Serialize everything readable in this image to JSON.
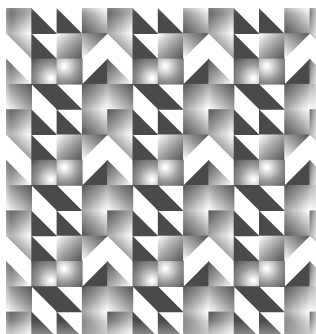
{
  "artwork": {
    "title": "Grayscale Geometric Quilt Pattern",
    "kind": "repeating-tile-pattern",
    "canvas": {
      "width": 316,
      "height": 334,
      "background": "#ffffff"
    },
    "pattern_area": {
      "x": 6,
      "y": 8,
      "width": 304,
      "height": 316
    },
    "grid": {
      "cell_size": 25.3,
      "columns": 12,
      "rows": 12.5,
      "motif_period_cells": 4
    },
    "palette": {
      "background": "#ffffff",
      "dark": "#4a4a4a",
      "mid_dark": "#6e6e6e",
      "mid": "#9a9a9a",
      "light": "#d8d8d8",
      "highlight": "#ffffff",
      "gradient_dark_stop": "#555555",
      "gradient_light_stop": "#ffffff"
    },
    "shapes": {
      "gradient_square": "square filled with a linear/radial grayscale gradient",
      "triangle_lower_left": "right triangle occupying the lower-left half of a cell",
      "triangle_upper_right": "right triangle occupying the upper-right half of a cell",
      "triangle_lower_right": "right triangle occupying the lower-right half of a cell",
      "triangle_upper_left": "right triangle occupying the upper-left half of a cell",
      "arrow_block": "large dark arrow / chevron formed by adjoining triangles",
      "nested_corner": "L-shaped nested corner of gradient squares"
    },
    "motif": {
      "size_cells": 4,
      "description": "Four-by-four cell tile combining dark solid triangles forming arrow heads with radial gradient squares that fade from dark grey at one corner to white at the opposite corner.",
      "cells": [
        [
          "gradient_square_tl_dark",
          "triangle_lower_left_dark",
          "triangle_lower_left_dark",
          "gradient_square_bl_dark"
        ],
        [
          "triangle_upper_right_grad",
          "triangle_lower_left_dark",
          "gradient_square_br_dark",
          "triangle_upper_left_grad"
        ],
        [
          "triangle_lower_left_grad",
          "gradient_square_radial",
          "nested_corner_grad",
          "triangle_lower_right_dark"
        ],
        [
          "gradient_square_tr_dark",
          "triangle_upper_right_dark",
          "triangle_lower_left_dark",
          "gradient_square_tl_dark"
        ]
      ]
    },
    "counts": {
      "motif_repeats_x": 3,
      "motif_repeats_y": 3,
      "approx_cells_total": 150
    }
  },
  "chart_data": {
    "type": "heatmap",
    "title": "Grayscale Geometric Quilt Pattern",
    "xlabel": "",
    "ylabel": "",
    "grid": true,
    "legend": "none",
    "categories": [
      "col1",
      "col2",
      "col3",
      "col4",
      "col5",
      "col6",
      "col7",
      "col8",
      "col9",
      "col10",
      "col11",
      "col12"
    ],
    "values": [
      [
        0.55,
        0.85,
        0.85,
        0.55,
        0.55,
        0.85,
        0.85,
        0.55,
        0.55,
        0.85,
        0.85,
        0.55
      ],
      [
        0.4,
        0.85,
        0.6,
        0.4,
        0.4,
        0.85,
        0.6,
        0.4,
        0.4,
        0.85,
        0.6,
        0.4
      ],
      [
        0.45,
        0.5,
        0.35,
        0.8,
        0.45,
        0.5,
        0.35,
        0.8,
        0.45,
        0.5,
        0.35,
        0.8
      ],
      [
        0.55,
        0.85,
        0.85,
        0.55,
        0.55,
        0.85,
        0.85,
        0.55,
        0.55,
        0.85,
        0.85,
        0.55
      ],
      [
        0.55,
        0.85,
        0.85,
        0.55,
        0.55,
        0.85,
        0.85,
        0.55,
        0.55,
        0.85,
        0.85,
        0.55
      ],
      [
        0.4,
        0.85,
        0.6,
        0.4,
        0.4,
        0.85,
        0.6,
        0.4,
        0.4,
        0.85,
        0.6,
        0.4
      ],
      [
        0.45,
        0.5,
        0.35,
        0.8,
        0.45,
        0.5,
        0.35,
        0.8,
        0.45,
        0.5,
        0.35,
        0.8
      ],
      [
        0.55,
        0.85,
        0.85,
        0.55,
        0.55,
        0.85,
        0.85,
        0.55,
        0.55,
        0.85,
        0.85,
        0.55
      ],
      [
        0.55,
        0.85,
        0.85,
        0.55,
        0.55,
        0.85,
        0.85,
        0.55,
        0.55,
        0.85,
        0.85,
        0.55
      ],
      [
        0.4,
        0.85,
        0.6,
        0.4,
        0.4,
        0.85,
        0.6,
        0.4,
        0.4,
        0.85,
        0.6,
        0.4
      ],
      [
        0.45,
        0.5,
        0.35,
        0.8,
        0.45,
        0.5,
        0.35,
        0.8,
        0.45,
        0.5,
        0.35,
        0.8
      ],
      [
        0.55,
        0.85,
        0.85,
        0.55,
        0.55,
        0.85,
        0.85,
        0.55,
        0.55,
        0.85,
        0.85,
        0.55
      ]
    ]
  }
}
